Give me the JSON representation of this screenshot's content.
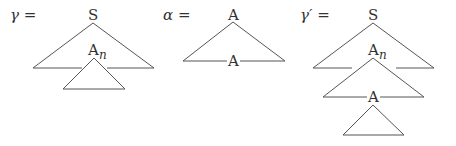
{
  "diagrams": [
    {
      "name": "gamma",
      "equation_label": "γ =",
      "root_label": "S",
      "adjoin_node": {
        "label": "A",
        "subscript": "n"
      }
    },
    {
      "name": "alpha",
      "equation_label": "α =",
      "root_label": "A",
      "foot_label": "A"
    },
    {
      "name": "gamma-prime",
      "equation_label": "γ′ =",
      "root_label": "S",
      "adjoin_node": {
        "label": "A",
        "subscript": "n"
      },
      "foot_label": "A"
    }
  ],
  "colors": {
    "stroke": "#555555",
    "text": "#333333",
    "background": "#ffffff"
  }
}
